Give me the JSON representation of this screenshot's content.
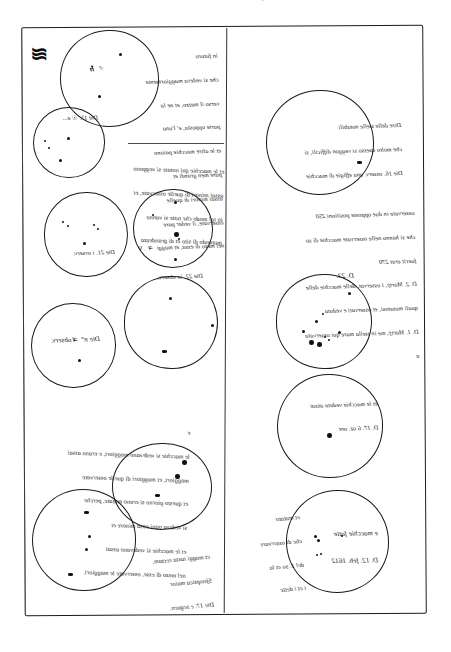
{
  "page": {
    "top_cut_text": "di 9 ap 1 d 4 5 6 3 1 2 7",
    "frame_label": "manuscript-frame"
  },
  "left_column": {
    "blob_glyph": "≋",
    "disks": [
      {
        "id": "disk-1",
        "caption_lines": [],
        "inner_mark": "V ♃",
        "spots": [
          {
            "size": "md",
            "x": 58,
            "y": 22
          },
          {
            "size": "md",
            "x": 37,
            "y": 64
          },
          {
            "size": "sm",
            "x": 29,
            "y": 38
          }
        ]
      },
      {
        "id": "disk-2",
        "caption_lines": [
          "Die 1°. ☉ e..."
        ],
        "spots": [
          {
            "size": "sm",
            "x": 10,
            "y": 32
          },
          {
            "size": "sm",
            "x": 14,
            "y": 39
          },
          {
            "size": "md",
            "x": 33,
            "y": 29
          },
          {
            "size": "md",
            "x": 25,
            "y": 51
          }
        ]
      },
      {
        "id": "disk-3",
        "caption_lines": [
          "Die 21. i ovserv."
        ],
        "spots": [
          {
            "size": "sm",
            "x": 17,
            "y": 28
          },
          {
            "size": "sm",
            "x": 22,
            "y": 32
          },
          {
            "size": "sm",
            "x": 48,
            "y": 31
          },
          {
            "size": "sm",
            "x": 52,
            "y": 35
          },
          {
            "size": "md",
            "x": 38,
            "y": 49
          }
        ]
      },
      {
        "id": "disk-4",
        "caption_lines": [
          "Die 22. in observ."
        ],
        "spots": [
          {
            "size": "md",
            "x": 40,
            "y": 11
          },
          {
            "size": "sm",
            "x": 18,
            "y": 24
          },
          {
            "size": "lg",
            "x": 40,
            "y": 42
          },
          {
            "size": "sm",
            "x": 44,
            "y": 47
          },
          {
            "size": "md",
            "x": 40,
            "y": 68
          }
        ]
      },
      {
        "id": "disk-5",
        "caption_lines": [
          "Die n° ♃ observ."
        ],
        "spots": [
          {
            "size": "md",
            "x": 46,
            "y": 55
          }
        ]
      },
      {
        "id": "disk-6",
        "caption_lines": [],
        "spots": [
          {
            "size": "md",
            "x": 44,
            "y": 20
          },
          {
            "size": "md",
            "x": 86,
            "y": 47
          },
          {
            "size": "dash",
            "x": 37,
            "y": 73
          }
        ]
      },
      {
        "id": "disk-7",
        "caption_lines": [],
        "spots": [
          {
            "size": "lg",
            "x": 69,
            "y": 16
          },
          {
            "size": "lg",
            "x": 62,
            "y": 30
          },
          {
            "size": "dash",
            "x": 42,
            "y": 50
          }
        ]
      },
      {
        "id": "disk-8",
        "caption_lines": [
          "Die 17. e seguen.",
          "Sŷnoptica maior",
          "et maggi iuxta rectam."
        ],
        "spots": [
          {
            "size": "dash",
            "x": 51,
            "y": 21
          },
          {
            "size": "md",
            "x": 55,
            "y": 45
          },
          {
            "size": "md",
            "x": 52,
            "y": 58
          },
          {
            "size": "dash",
            "x": 35,
            "y": 83
          }
        ]
      }
    ],
    "notes": [
      {
        "id": "note-left-top",
        "lines": [
          "in futuro",
          "che si vedeva maggiormente",
          "verso il mezzo, et ne la",
          "parte opposta, e' l'una",
          "et le altre macchie paiono",
          "pure men grandi et",
          "assai minori di quelle",
          "osservate, il veder pare",
          "nel mezo di essa, et maggi  ♃ . V"
        ]
      },
      {
        "id": "note-left-second",
        "lines": [
          "et le macchie qui notate si veggono",
          "assai minori di quelle osservate, et",
          "in tal modo che tutte si vanno",
          "mutando di sito et di grandezza"
        ]
      },
      {
        "id": "note-left-lower",
        "lines": [
          "e",
          "le macchie si vedevano maggiori, e erano assai",
          "maggiori, et maggiori di quelle osservate",
          "et questo giorno si erano mutate, perche",
          "si vedeva ogni cosa minore et",
          "et le macchie si vedevano assai",
          "nel mezo di esse, osservate le maggiori."
        ]
      }
    ]
  },
  "right_column": {
    "disks": [
      {
        "id": "disk-r1",
        "caption_lines": [
          "Die 16. osserv. una effigie di macchie",
          "che molto spesso si veggon difficili, si",
          "Dire delle stelle notabili"
        ],
        "spots": [
          {
            "size": "dash",
            "x": 90,
            "y": 70
          }
        ]
      },
      {
        "id": "disk-r2",
        "caption_lines": [
          "D. 23."
        ],
        "spots": [
          {
            "size": "md",
            "x": 71,
            "y": 17
          },
          {
            "size": "sm",
            "x": 45,
            "y": 38
          },
          {
            "size": "md",
            "x": 38,
            "y": 45
          },
          {
            "size": "md",
            "x": 25,
            "y": 55
          },
          {
            "size": "lg",
            "x": 32,
            "y": 65
          },
          {
            "size": "lg",
            "x": 40,
            "y": 67
          },
          {
            "size": "sm",
            "x": 47,
            "y": 61
          },
          {
            "size": "sm",
            "x": 51,
            "y": 64
          },
          {
            "size": "md",
            "x": 61,
            "y": 56
          }
        ]
      },
      {
        "id": "disk-r3",
        "caption_lines": [
          "D. 17. 6 oz. ore",
          "et le macchie veduta assai"
        ],
        "spots": [
          {
            "size": "lg",
            "x": 49,
            "y": 58
          }
        ]
      },
      {
        "id": "disk-r4",
        "caption_lines": [
          "D. 12. feb. 1612",
          "e macchie fatte"
        ],
        "spots": [
          {
            "size": "md",
            "x": 27,
            "y": 44
          },
          {
            "size": "md",
            "x": 30,
            "y": 48
          },
          {
            "size": "sm",
            "x": 54,
            "y": 44
          },
          {
            "size": "sm",
            "x": 33,
            "y": 62
          },
          {
            "size": "sm",
            "x": 29,
            "y": 63
          }
        ]
      }
    ],
    "notes": [
      {
        "id": "note-right-top",
        "lines": [
          "osservate in due opposte positioni 250",
          "che si hanno nelle osservate macchie di so",
          "fuerit erat 270",
          "D. 2. Martÿ, i osservat. delle macchie delle",
          "quali mutatosi, et osservati e veduta",
          "D. 1. Martÿ, me in stella mare qui osservata",
          "a"
        ]
      },
      {
        "id": "note-right-bottom",
        "lines": [
          "et mutato",
          "che di osservare",
          "del 1. so et la",
          "i et i dette"
        ]
      }
    ]
  }
}
